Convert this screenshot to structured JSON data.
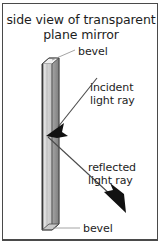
{
  "diagram": {
    "title_line1": "side view of transparent",
    "title_line2": "plane mirror",
    "labels": {
      "bevel_top": "bevel",
      "bevel_bottom": "bevel",
      "incident_line1": "incident",
      "incident_line2": "light ray",
      "reflected_line1": "reflected",
      "reflected_line2": "light ray"
    },
    "colors": {
      "frame": "#4a4a4a",
      "background": "#ffffff",
      "text": "#1d1d1d",
      "plate_edge_dark": "#3a3a3a",
      "plate_face_light": "#d8d8d8",
      "plate_face_mid": "#bdbdbd",
      "plate_back_dark": "#8a8a8a",
      "ray_line": "#4a4a4a",
      "arrow_fill": "#111111",
      "leader_line": "#9a9a9a"
    }
  }
}
